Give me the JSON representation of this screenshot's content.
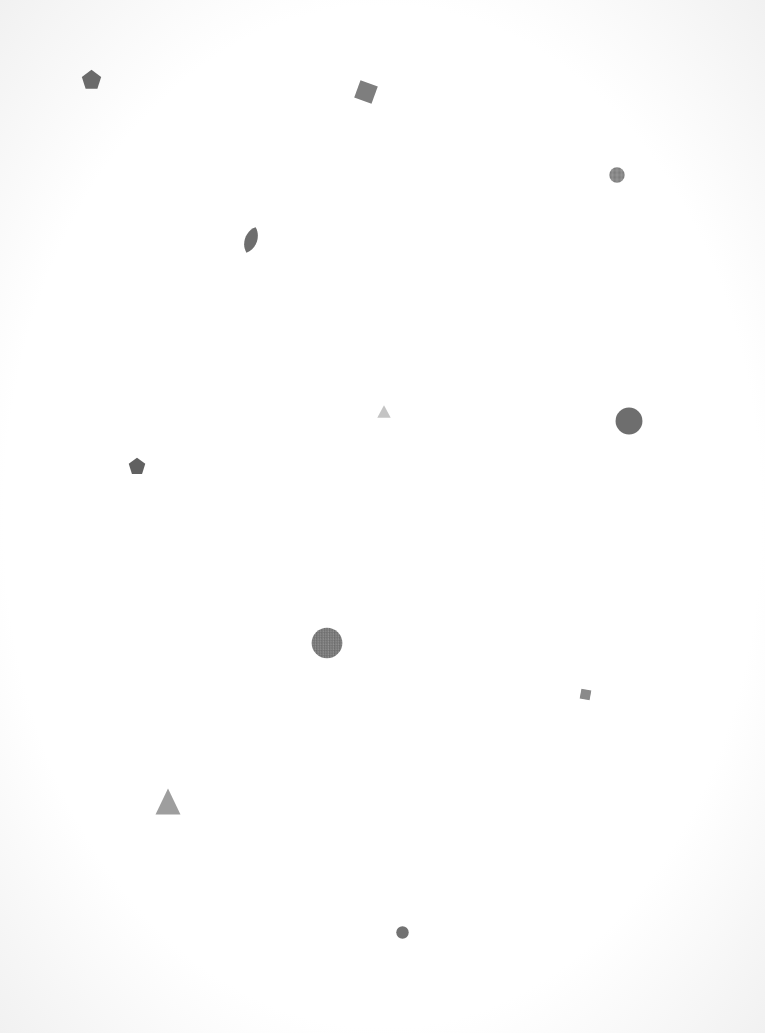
{
  "canvas": {
    "width": 765,
    "height": 1033,
    "background": "#ffffff"
  },
  "shapes": [
    {
      "id": "pentagon-1",
      "type": "pentagon",
      "cx": 91,
      "cy": 79,
      "w": 21,
      "h": 21,
      "rotate": 0,
      "color": "#6a6a6a"
    },
    {
      "id": "square-1",
      "type": "square",
      "cx": 366,
      "cy": 92,
      "w": 20,
      "h": 20,
      "rotate": 20,
      "color": "#7e7e7e"
    },
    {
      "id": "circle-1",
      "type": "circle",
      "cx": 617,
      "cy": 175,
      "w": 16,
      "h": 16,
      "rotate": 0,
      "color": "#8a8a8a",
      "textured": true
    },
    {
      "id": "leaf-1",
      "type": "leaf",
      "cx": 251,
      "cy": 240,
      "w": 18,
      "h": 28,
      "rotate": 20,
      "color": "#6e6e6e"
    },
    {
      "id": "triangle-1",
      "type": "triangle",
      "cx": 384,
      "cy": 411,
      "w": 14,
      "h": 13,
      "rotate": 0,
      "color": "#c4c4c4"
    },
    {
      "id": "circle-2",
      "type": "circle",
      "cx": 629,
      "cy": 421,
      "w": 28,
      "h": 28,
      "rotate": 0,
      "color": "#6e6e6e"
    },
    {
      "id": "pentagon-2",
      "type": "pentagon",
      "cx": 137,
      "cy": 466,
      "w": 18,
      "h": 18,
      "rotate": 0,
      "color": "#616161"
    },
    {
      "id": "circle-3",
      "type": "circle",
      "cx": 327,
      "cy": 643,
      "w": 32,
      "h": 32,
      "rotate": 0,
      "color": "#7a7a7a",
      "textured": true
    },
    {
      "id": "square-2",
      "type": "square",
      "cx": 585,
      "cy": 694,
      "w": 11,
      "h": 11,
      "rotate": 10,
      "color": "#8a8a8a"
    },
    {
      "id": "triangle-2",
      "type": "triangle",
      "cx": 168,
      "cy": 801,
      "w": 26,
      "h": 27,
      "rotate": 0,
      "color": "#9e9e9e"
    },
    {
      "id": "circle-4",
      "type": "circle",
      "cx": 402,
      "cy": 932,
      "w": 13,
      "h": 13,
      "rotate": 0,
      "color": "#727272"
    }
  ]
}
